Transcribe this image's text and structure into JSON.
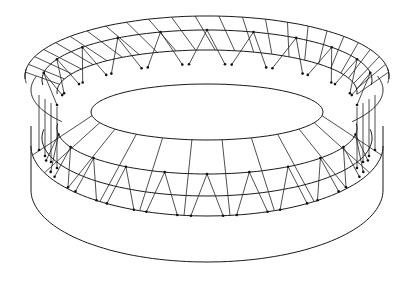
{
  "figure": {
    "title": "",
    "stroke_color": "#1a1a1a",
    "background": "#ffffff"
  },
  "geometry": {
    "center_x": 207,
    "roof_outer": {
      "cy": 76,
      "rx": 182,
      "ry": 60
    },
    "roof_ring2": {
      "cy": 80,
      "rx": 165,
      "ry": 50
    },
    "roof_ring3": {
      "cy": 92,
      "rx": 150,
      "ry": 42
    },
    "opening": {
      "cy": 112,
      "rx": 116,
      "ry": 28
    },
    "seating_ring1": {
      "cy": 128,
      "rx": 150,
      "ry": 46
    },
    "seating_ring2": {
      "cy": 138,
      "rx": 165,
      "ry": 58
    },
    "base_top": {
      "cy": 146,
      "rx": 176,
      "ry": 70
    },
    "base_bottom": {
      "cy": 190,
      "rx": 176,
      "ry": 72
    },
    "radial_divisions": 24,
    "strut_pairs": 22
  }
}
